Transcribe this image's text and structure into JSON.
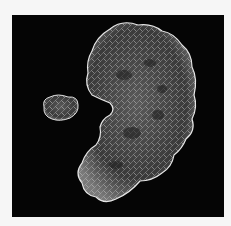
{
  "image": {
    "subject": "molecular surface mesh rendering",
    "description": "Two white wireframe/translucent molecular surfaces on a black background: a small globular ligand-like blob on the left and a large kidney-shaped protein surface on the right",
    "colors": {
      "page_background": "#f6f6f6",
      "panel_background": "#050505",
      "surface_stroke": "#e8e8e8",
      "surface_fill": "#8a8a8a"
    }
  }
}
